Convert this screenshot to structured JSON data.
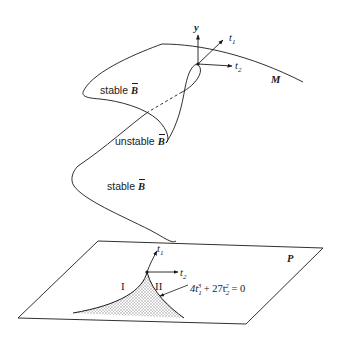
{
  "figure": {
    "surface_label": "M",
    "plane_label": "P",
    "upper_axes": {
      "y_label": "y",
      "t1_label": "t",
      "t1_sub": "1",
      "t2_label": "t",
      "t2_sub": "2"
    },
    "lower_axes": {
      "t1_label": "t",
      "t1_sub": "1",
      "t2_label": "t",
      "t2_sub": "2"
    },
    "branch_labels": {
      "stable_upper": "stable",
      "unstable": "unstable",
      "stable_lower": "stable",
      "symbol": "B"
    },
    "regions": {
      "region_1": "I",
      "region_2": "II"
    },
    "equation": {
      "c1": "4t",
      "sub1": "1",
      "sup1": "3",
      "mid": " + 27t",
      "sub2": "2",
      "sup2": "2",
      "rhs": " = 0"
    },
    "colors": {
      "ink": "#1a1a1a",
      "background": "#ffffff",
      "shading": "#b5b5b5"
    }
  }
}
